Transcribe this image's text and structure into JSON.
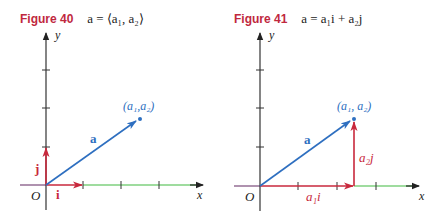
{
  "colors": {
    "title_red": "#c0283e",
    "unit_vector_red": "#c8283c",
    "vector_blue": "#2e6fc0",
    "axis_dark": "#333333",
    "x_axis_green": "#7fd07f",
    "axis_purple": "#7a4a7a"
  },
  "figures": [
    {
      "number_label": "Figure 40",
      "formula_text": "a = ⟨a₁, a₂⟩",
      "formula": {
        "lhs": "a",
        "eq": " = ",
        "rhs": "⟨a₁, a₂⟩"
      },
      "axis_labels": {
        "x": "x",
        "y": "y",
        "origin": "O"
      },
      "vector_labels": {
        "a": "a",
        "i": "i",
        "j": "j"
      },
      "point_label": "(a₁,a₂)"
    },
    {
      "number_label": "Figure 41",
      "formula_text": "a = a₁i + a₂j",
      "formula": {
        "lhs": "a",
        "eq": " = ",
        "rhs": "a₁i + a₂j"
      },
      "axis_labels": {
        "x": "x",
        "y": "y",
        "origin": "O"
      },
      "vector_labels": {
        "a": "a",
        "a1i": "a₁i",
        "a2j": "a₂j"
      },
      "point_label": "(a₁, a₂)"
    }
  ]
}
